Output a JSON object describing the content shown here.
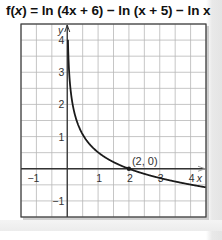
{
  "title": {
    "prefix": "f(",
    "var": "x",
    "rest": ") = ln (4x + 6) − ln (x + 5) − ln x",
    "full": "f(x) = ln (4x + 6) − ln (x + 5) − ln x"
  },
  "colors": {
    "grid": "#b8b8b8",
    "axis": "#333333",
    "curve": "#1a1a1a",
    "border": "#3a3a3a",
    "label": "#333333",
    "shadow": "#999999"
  },
  "labels": {
    "y_axis": "y",
    "x_axis": "x",
    "point": "(2, 0)"
  },
  "chart_data": {
    "type": "line",
    "title": "f(x) = ln (4x + 6) − ln (x + 5) − ln x",
    "xlabel": "x",
    "ylabel": "y",
    "xlim": [
      -1.5,
      4.5
    ],
    "ylim": [
      -1.5,
      4.5
    ],
    "grid": true,
    "grid_step": 0.5,
    "x_ticks": [
      -1,
      1,
      2,
      3,
      4
    ],
    "y_ticks": [
      -1,
      1,
      2,
      3,
      4
    ],
    "x_tick_labels": [
      "−1",
      "1",
      "2",
      "3",
      "4"
    ],
    "y_tick_labels": [
      "−1",
      "1",
      "2",
      "3",
      "4"
    ],
    "series": [
      {
        "name": "f(x) = ln (4x + 6) − ln (x + 5) − ln x",
        "x": [
          0.02,
          0.03,
          0.05,
          0.1,
          0.25,
          0.5,
          1,
          1.5,
          2,
          3,
          4,
          4.5
        ],
        "y": [
          4.1,
          3.7,
          3.2,
          2.53,
          1.67,
          1.07,
          0.51,
          0.21,
          0,
          -0.29,
          -0.49,
          -0.58
        ]
      }
    ],
    "annotations": [
      {
        "text": "(2, 0)",
        "x": 2,
        "y": 0,
        "marker": "dot"
      }
    ],
    "legend": "none"
  }
}
